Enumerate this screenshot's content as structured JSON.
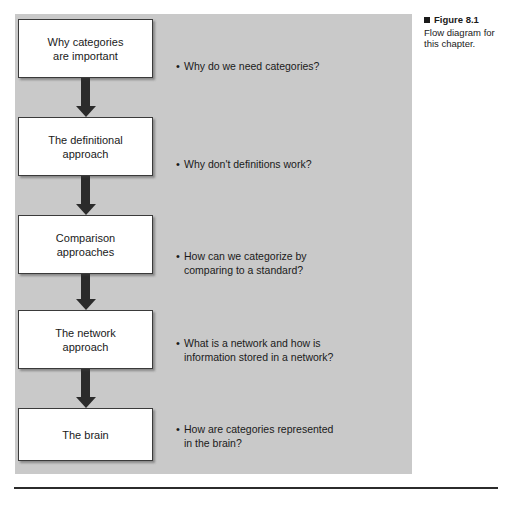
{
  "figure": {
    "caption": {
      "marker": "black-square-marker",
      "heading": "Figure 8.1",
      "body": "Flow diagram for this chapter."
    },
    "panel_color": "#c9c9c9",
    "box_fill": "#ffffff",
    "box_border": "#3a3a3a",
    "arrow_color": "#2b2b2b",
    "text_color": "#1a1a1a"
  },
  "flow": {
    "nodes": [
      {
        "label": "Why categories\nare important"
      },
      {
        "label": "The definitional\napproach"
      },
      {
        "label": "Comparison\napproaches"
      },
      {
        "label": "The network\napproach"
      },
      {
        "label": "The brain"
      }
    ],
    "arrows": [
      {
        "name": "arrow-1",
        "direction": "down"
      },
      {
        "name": "arrow-2",
        "direction": "down"
      },
      {
        "name": "arrow-3",
        "direction": "down"
      },
      {
        "name": "arrow-4",
        "direction": "down"
      }
    ]
  },
  "bullets": [
    {
      "marker": "•",
      "text": "Why do we need categories?"
    },
    {
      "marker": "•",
      "text": "Why don't definitions work?"
    },
    {
      "marker": "•",
      "text": "How can we categorize by\ncomparing to a standard?"
    },
    {
      "marker": "•",
      "text": "What is a network and how is\ninformation stored in a network?"
    },
    {
      "marker": "•",
      "text": "How are categories represented\nin the brain?"
    }
  ]
}
